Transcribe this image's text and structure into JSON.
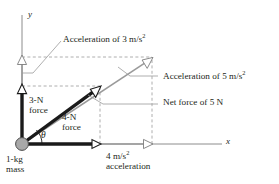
{
  "figure": {
    "axes": {
      "x_label": "x",
      "y_label": "y",
      "origin_px": [
        22,
        144
      ]
    },
    "colors": {
      "force_vector": "#1a1a1a",
      "acceleration_vector": "#9a9a9a",
      "axis": "#8c8c8c",
      "dashed_guide": "#9a9a9a",
      "leader_line": "#9a9a9a",
      "mass_fill": "#a8a8a8",
      "mass_stroke": "#4d4d4d",
      "text": "#231f20"
    },
    "vectors": [
      {
        "name": "3-N force",
        "label_line1": "3-N",
        "label_line2": "force",
        "magnitude": 3,
        "unit": "N",
        "direction": "+y",
        "style": "solid-black-thick",
        "tip_px": [
          22,
          86
        ]
      },
      {
        "name": "4-N force",
        "label_line1": "4-N",
        "label_line2": "force",
        "magnitude": 4,
        "unit": "N",
        "direction": "+x",
        "style": "solid-black-thick",
        "tip_px": [
          100,
          144
        ]
      },
      {
        "name": "Net force of 5 N",
        "label": "Net force of 5 N",
        "magnitude": 5,
        "unit": "N",
        "direction": "theta above +x",
        "style": "solid-black-thick",
        "tip_px": [
          100,
          86
        ]
      },
      {
        "name": "Acceleration of 3 m/s^2",
        "label_prefix": "Acceleration of 3 m/s",
        "label_exponent": "2",
        "magnitude": 3,
        "unit": "m/s^2",
        "direction": "+y",
        "style": "hollow-gray",
        "tip_px": [
          22,
          57
        ]
      },
      {
        "name": "4 m/s^2 acceleration",
        "label_line1_prefix": "4 m/s",
        "label_line1_exponent": "2",
        "label_line2": "acceleration",
        "magnitude": 4,
        "unit": "m/s^2",
        "direction": "+x",
        "style": "hollow-gray",
        "tip_px": [
          152,
          144
        ]
      },
      {
        "name": "Acceleration of 5 m/s^2",
        "label_prefix": "Acceleration of 5 m/s",
        "label_exponent": "2",
        "magnitude": 5,
        "unit": "m/s^2",
        "direction": "theta above +x",
        "style": "hollow-gray",
        "tip_px": [
          152,
          57
        ]
      }
    ],
    "mass": {
      "label_line1": "1-kg",
      "label_line2": "mass",
      "value": 1,
      "unit": "kg"
    },
    "angle": {
      "symbol": "θ",
      "name": "theta"
    }
  }
}
